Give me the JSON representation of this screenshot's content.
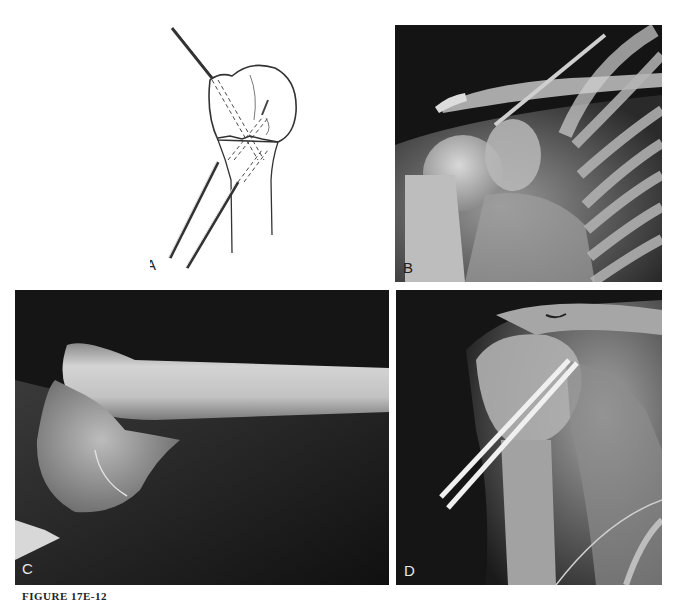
{
  "figure": {
    "caption": "FIGURE 17E-12",
    "panels": [
      {
        "id": "A",
        "label": "A",
        "type": "illustration",
        "description": "Line drawing of proximal humerus fracture fixed with percutaneous pins"
      },
      {
        "id": "B",
        "label": "B",
        "type": "radiograph",
        "description": "AP shoulder radiograph showing displaced proximal humerus fracture"
      },
      {
        "id": "C",
        "label": "C",
        "type": "radiograph",
        "description": "Lateral radiograph of displaced proximal humeral fracture"
      },
      {
        "id": "D",
        "label": "D",
        "type": "radiograph",
        "description": "AP radiograph after reduction and fixation with two percutaneous pins"
      }
    ]
  },
  "colors": {
    "page_background": "#ffffff",
    "radiograph_background": "#111111",
    "bone": "#bdbdbd",
    "pin": "#e6e6e6",
    "line_art": "#333333"
  }
}
